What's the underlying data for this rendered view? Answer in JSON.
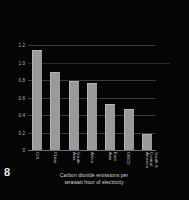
{
  "figure": {
    "page_number": "8",
    "background_color": "#050505",
    "bar_color": "#9a9a9a",
    "grid_color": "#3a3a3a",
    "text_color": "#cfcfcf"
  },
  "caption": {
    "line1": "Carbon dioxide emissions per",
    "line2": "terawatt hour of electricity"
  },
  "chart_data": {
    "type": "bar",
    "title": "",
    "subtitle": "",
    "categories": [
      "CIS",
      "China",
      "South Asia",
      "Africa",
      "East Asia",
      "OECD",
      "South & Central America"
    ],
    "category_lines": [
      [
        "CIS"
      ],
      [
        "China"
      ],
      [
        "South",
        "Asia"
      ],
      [
        "Africa"
      ],
      [
        "East",
        "Asia"
      ],
      [
        "OECD"
      ],
      [
        "South &",
        "Central",
        "America"
      ]
    ],
    "values": [
      1.13,
      0.88,
      0.78,
      0.76,
      0.51,
      0.46,
      0.17
    ],
    "xlabel": "",
    "ylabel": "",
    "ylim": [
      0,
      1.2
    ],
    "yticks": [
      1.2,
      1.0,
      0.8,
      0.6,
      0.4,
      0.2,
      0
    ],
    "ytick_labels": [
      "1.2",
      "1.0",
      "0.8",
      "0.6",
      "0.4",
      "0.2",
      "0"
    ],
    "grid": true,
    "legend": false,
    "annotations": [
      {
        "name": "reference-line",
        "value": 1.0,
        "description": "faint horizontal reference line near 1.0 extending past plot"
      }
    ]
  }
}
